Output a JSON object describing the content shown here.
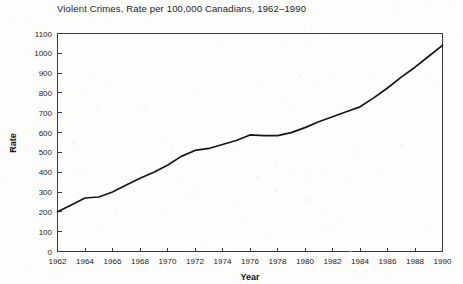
{
  "figure": {
    "background_color": "#fdfdfc",
    "line_color": "#161616",
    "axis_color": "#3a3a3a",
    "text_color": "#1b1b1b"
  },
  "chart_data": {
    "type": "line",
    "title": "Violent Crimes, Rate per 100,000 Canadians, 1962–1990",
    "xlabel": "Year",
    "ylabel": "Rate",
    "xlim": [
      1962,
      1990
    ],
    "ylim": [
      0,
      1100
    ],
    "grid": false,
    "legend": null,
    "xticks": [
      1962,
      1964,
      1966,
      1968,
      1970,
      1972,
      1974,
      1976,
      1978,
      1980,
      1982,
      1984,
      1986,
      1988,
      1990
    ],
    "xtick_labels": [
      "1962",
      "1964",
      "1966",
      "1968",
      "1970",
      "1972",
      "1974",
      "1976",
      "1978",
      "1980",
      "1982",
      "1984",
      "1986",
      "1988",
      "1990"
    ],
    "yticks": [
      0,
      100,
      200,
      300,
      400,
      500,
      600,
      700,
      800,
      900,
      1000,
      1100
    ],
    "ytick_labels": [
      "0",
      "100",
      "200",
      "300",
      "400",
      "500",
      "600",
      "700",
      "800",
      "900",
      "1000",
      "1100"
    ],
    "x": [
      1962,
      1963,
      1964,
      1965,
      1966,
      1967,
      1968,
      1969,
      1970,
      1971,
      1972,
      1973,
      1974,
      1975,
      1976,
      1977,
      1978,
      1979,
      1980,
      1981,
      1982,
      1983,
      1984,
      1985,
      1986,
      1987,
      1988,
      1989,
      1990
    ],
    "values": [
      200,
      235,
      270,
      275,
      300,
      335,
      370,
      400,
      435,
      480,
      510,
      520,
      540,
      560,
      588,
      585,
      585,
      600,
      625,
      655,
      680,
      705,
      730,
      775,
      825,
      880,
      930,
      985,
      1040
    ],
    "series": [
      {
        "name": "Violent crime rate per 100,000",
        "values": [
          200,
          235,
          270,
          275,
          300,
          335,
          370,
          400,
          435,
          480,
          510,
          520,
          540,
          560,
          588,
          585,
          585,
          600,
          625,
          655,
          680,
          705,
          730,
          775,
          825,
          880,
          930,
          985,
          1040
        ]
      }
    ]
  }
}
